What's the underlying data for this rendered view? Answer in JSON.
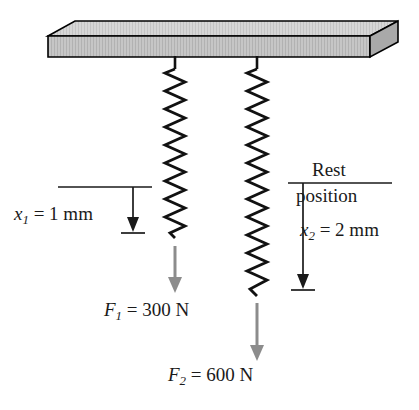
{
  "figure": {
    "background_color": "#ffffff",
    "width": 419,
    "height": 410
  },
  "ceiling": {
    "name": "ceiling-slab",
    "top_face_color": "#d2d2d2",
    "front_face_color": "#bdbdbd",
    "side_face_color": "#a8a8a8",
    "outline_color": "#000000"
  },
  "springs": [
    {
      "id": "spring-1",
      "center_x": 175,
      "top_y": 56,
      "bottom_y": 238,
      "coils": 18,
      "color": "#111111"
    },
    {
      "id": "spring-2",
      "center_x": 257,
      "top_y": 56,
      "bottom_y": 296,
      "coils": 24,
      "color": "#111111"
    }
  ],
  "force_arrows": [
    {
      "id": "force-arrow-1",
      "x": 175,
      "from_y": 246,
      "to_y": 292,
      "color": "#8c8c8c"
    },
    {
      "id": "force-arrow-2",
      "x": 257,
      "from_y": 303,
      "to_y": 360,
      "color": "#8c8c8c"
    }
  ],
  "dimensions": [
    {
      "id": "dimension-x1",
      "reference_line_from_x": 58,
      "reference_line_to_x": 152,
      "reference_line_y": 187,
      "arrow_x": 133,
      "arrow_from_y": 187,
      "arrow_to_y": 231,
      "tick_half_width": 12,
      "color": "#111111"
    },
    {
      "id": "dimension-x2",
      "reference_line_from_x": 288,
      "reference_line_to_x": 392,
      "reference_line_y": 183,
      "arrow_x": 303,
      "arrow_from_y": 183,
      "arrow_to_y": 288,
      "tick_half_width": 12,
      "color": "#111111"
    }
  ],
  "labels": {
    "x1": {
      "symbol": "x",
      "subscript": "1",
      "equals": " = ",
      "value": "1 mm",
      "full_text": "x1 = 1 mm"
    },
    "x2": {
      "symbol": "x",
      "subscript": "2",
      "equals": " = ",
      "value": "2 mm",
      "full_text": "x2 = 2 mm"
    },
    "rest": "Rest",
    "position": "position",
    "f1": {
      "symbol": "F",
      "subscript": "1",
      "equals": " = ",
      "value": "300 N",
      "full_text": "F1 = 300 N"
    },
    "f2": {
      "symbol": "F",
      "subscript": "2",
      "equals": " = ",
      "value": "600 N",
      "full_text": "F2 = 600 N"
    }
  }
}
